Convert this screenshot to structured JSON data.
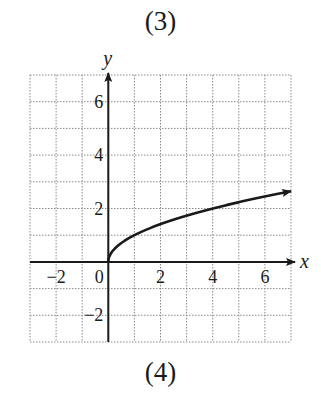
{
  "labels": {
    "top": "(3)",
    "bottom": "(4)"
  },
  "chart_data": {
    "type": "line",
    "title": "",
    "xlabel": "x",
    "ylabel": "y",
    "xlim": [
      -3,
      7
    ],
    "ylim": [
      -3,
      7
    ],
    "grid": true,
    "grid_style": "dotted",
    "x_ticks": [
      -2,
      0,
      2,
      4,
      6
    ],
    "x_tick_labels": [
      "−2",
      "0",
      "2",
      "4",
      "6"
    ],
    "y_ticks": [
      -2,
      2,
      4,
      6
    ],
    "y_tick_labels": [
      "−2",
      "2",
      "4",
      "6"
    ],
    "series": [
      {
        "name": "y = sqrt(x)",
        "function": "sqrt(x)",
        "x": [
          0,
          0.25,
          1,
          2,
          3,
          4,
          5,
          6,
          7
        ],
        "y": [
          0,
          0.5,
          1,
          1.41,
          1.73,
          2,
          2.24,
          2.45,
          2.65
        ],
        "end_arrow": true
      }
    ],
    "legend": null
  }
}
